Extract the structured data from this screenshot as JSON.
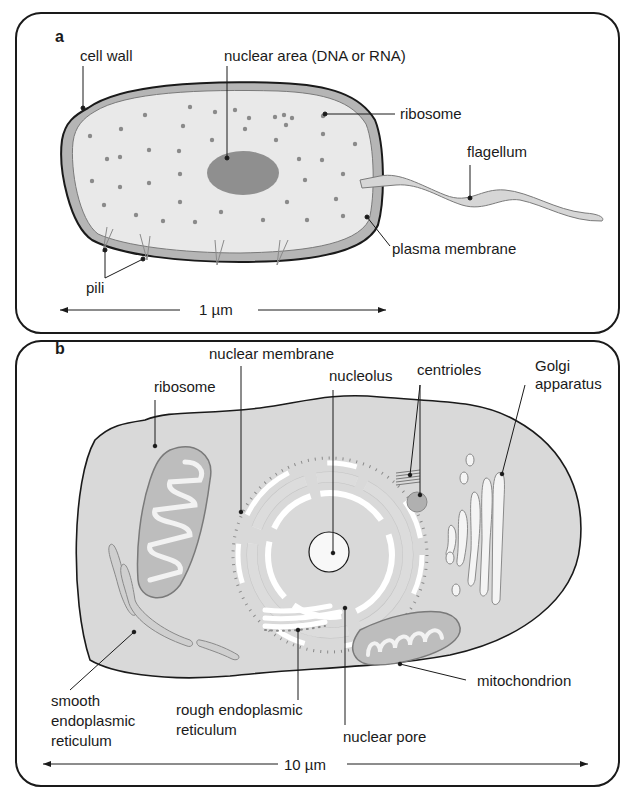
{
  "panel_a": {
    "letter": "a",
    "title": "Prokaryotic (bacterial) cell",
    "labels": {
      "cell_wall": "cell wall",
      "nuclear_area": "nuclear area (DNA or RNA)",
      "ribosome": "ribosome",
      "flagellum": "flagellum",
      "plasma_membrane": "plasma membrane",
      "pili": "pili"
    },
    "scale": "1 µm"
  },
  "panel_b": {
    "letter": "b",
    "title": "Eukaryotic (animal) cell",
    "labels": {
      "nuclear_membrane": "nuclear membrane",
      "ribosome": "ribosome",
      "nucleolus": "nucleolus",
      "centrioles": "centrioles",
      "golgi_line1": "Golgi",
      "golgi_line2": "apparatus",
      "ser_line1": "smooth",
      "ser_line2": "endoplasmic",
      "ser_line3": "reticulum",
      "rer_line1": "rough endoplasmic",
      "rer_line2": "reticulum",
      "nuclear_pore": "nuclear pore",
      "mitochondrion": "mitochondrion"
    },
    "scale": "10 µm"
  },
  "colors": {
    "outline": "#1a1a1a",
    "cell_wall": "#b5b5b5",
    "cytoplasm_a": "#e9e9e9",
    "nucleoid": "#8f8f8f",
    "ribosome_dot": "#8a8a8a",
    "cytoplasm_b": "#d9d9d9",
    "organelle_fill": "#f4f4f4",
    "mito_fill": "#bdbdbd"
  }
}
